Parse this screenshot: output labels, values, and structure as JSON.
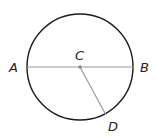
{
  "diagram": {
    "type": "circle-geometry",
    "center": {
      "label": "C",
      "x": 80,
      "y": 67
    },
    "radius": 53,
    "points": [
      {
        "label": "A",
        "x": 27,
        "y": 67
      },
      {
        "label": "B",
        "x": 134,
        "y": 67
      },
      {
        "label": "C",
        "x": 80,
        "y": 67
      },
      {
        "label": "D",
        "x": 106,
        "y": 115
      }
    ],
    "segments": [
      {
        "from": "A",
        "to": "B",
        "kind": "diameter"
      },
      {
        "from": "C",
        "to": "D",
        "kind": "radius"
      }
    ],
    "labels": {
      "A": "A",
      "B": "B",
      "C": "C",
      "D": "D"
    },
    "colors": {
      "circle": "#1a1a1a",
      "segments": "#9a9a9a",
      "center_dot": "#888888"
    }
  }
}
